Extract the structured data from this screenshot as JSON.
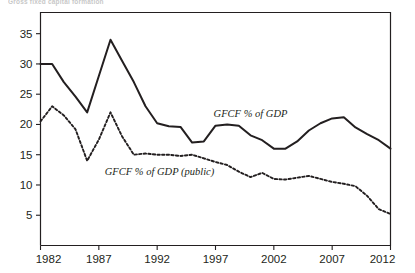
{
  "chart_data": {
    "type": "line",
    "title": "Gross fixed capital formation",
    "xlabel": "",
    "ylabel": "",
    "xlim": [
      1982,
      2012
    ],
    "ylim": [
      0,
      38.5
    ],
    "xticks": [
      1982,
      1987,
      1992,
      1997,
      2002,
      2007,
      2012
    ],
    "yticks": [
      5,
      10,
      15,
      20,
      25,
      30,
      35
    ],
    "xtick_labels": [
      "1982",
      "1987",
      "1992",
      "1997",
      "2002",
      "2007",
      "2012"
    ],
    "ytick_labels": [
      "5",
      "10",
      "15",
      "20",
      "25",
      "30",
      "35"
    ],
    "grid": false,
    "legend_position": "inline-annotation",
    "x": [
      1982,
      1983,
      1984,
      1985,
      1986,
      1987,
      1988,
      1989,
      1990,
      1991,
      1992,
      1993,
      1994,
      1995,
      1996,
      1997,
      1998,
      1999,
      2000,
      2001,
      2002,
      2003,
      2004,
      2005,
      2006,
      2007,
      2008,
      2009,
      2010,
      2011,
      2012
    ],
    "series": [
      {
        "name": "GFCF % of GDP",
        "style": "solid",
        "color": "#231f20",
        "label_x": 2000.0,
        "label_y": 21.3,
        "values": [
          30.0,
          30.0,
          27.0,
          24.6,
          22.0,
          28.0,
          34.0,
          30.5,
          27.0,
          23.0,
          20.2,
          19.7,
          19.6,
          17.0,
          17.2,
          19.8,
          20.0,
          19.8,
          18.2,
          17.4,
          16.0,
          16.0,
          17.2,
          19.0,
          20.2,
          21.0,
          21.2,
          19.5,
          18.4,
          17.4,
          16.0
        ]
      },
      {
        "name": "GFCF % of GDP (public)",
        "style": "dotted",
        "color": "#231f20",
        "label_x": 1992.2,
        "label_y": 11.6,
        "values": [
          20.5,
          23.0,
          21.5,
          19.2,
          14.0,
          17.5,
          22.0,
          18.0,
          15.0,
          15.2,
          15.0,
          15.0,
          14.8,
          15.0,
          14.4,
          13.8,
          13.3,
          12.2,
          11.3,
          12.0,
          11.0,
          10.9,
          11.2,
          11.5,
          11.0,
          10.5,
          10.2,
          9.8,
          8.2,
          6.0,
          5.2
        ]
      }
    ]
  }
}
